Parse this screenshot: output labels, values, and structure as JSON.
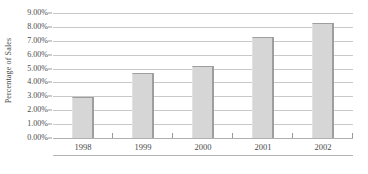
{
  "chart_data": {
    "type": "bar",
    "title": "",
    "subtitle": "",
    "xlabel": "",
    "ylabel": "Percentage of Sales",
    "categories": [
      "1998",
      "1999",
      "2000",
      "2001",
      "2002"
    ],
    "values": [
      2.95,
      4.65,
      5.15,
      7.3,
      8.3
    ],
    "value_labels": [
      "2.95%",
      "4.65%",
      "5.15%",
      "7.30%",
      "8.30%"
    ],
    "ylim": [
      0,
      9
    ],
    "ytick_values": [
      9,
      8,
      7,
      6,
      5,
      4,
      3,
      2,
      1,
      0
    ],
    "ytick_labels": [
      "9.00%",
      "8.00%",
      "7.00%",
      "6.00%",
      "5.00%",
      "4.00%",
      "3.00%",
      "2.00%",
      "1.00%",
      "0.00%"
    ],
    "grid": true,
    "grid_axis": "y",
    "legend": false,
    "legend_position": "none",
    "series": [
      {
        "name": "Percentage of Sales",
        "values": [
          2.95,
          4.65,
          5.15,
          7.3,
          8.3
        ]
      }
    ],
    "colors": {
      "bar_fill": "#d6d6d6",
      "bar_edge": "#9e9e9e",
      "gridline": "#c9c9c9",
      "axis": "#b0b0b0",
      "text": "#4a4a4a",
      "background": "#ffffff"
    }
  }
}
